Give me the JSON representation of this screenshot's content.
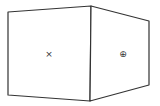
{
  "diagram": {
    "type": "perspective-box",
    "stroke_color": "#333333",
    "background": "#ffffff",
    "faces": [
      {
        "id": "left-face",
        "points": "8,12 91,6 90,101 8,95",
        "marker": {
          "symbol": "×",
          "x": 49,
          "y": 57
        }
      },
      {
        "id": "right-face",
        "points": "91,6 149,21 149,85 90,101",
        "marker": {
          "symbol": "⊕",
          "x": 123,
          "y": 57
        }
      }
    ]
  }
}
